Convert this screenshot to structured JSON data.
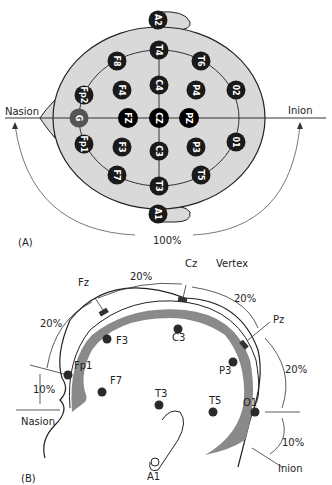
{
  "panel_a": {
    "label": "(A)",
    "nasion": "Nasion",
    "inion": "Inion",
    "arc_percent": "100%",
    "electrodes": [
      {
        "id": "A2",
        "type": "ear"
      },
      {
        "id": "A1",
        "type": "ear"
      },
      {
        "id": "T4",
        "type": "ring"
      },
      {
        "id": "F8",
        "type": "ring"
      },
      {
        "id": "T6",
        "type": "ring"
      },
      {
        "id": "Fp2",
        "type": "ring"
      },
      {
        "id": "02",
        "type": "ring"
      },
      {
        "id": "G",
        "type": "ground"
      },
      {
        "id": "Fp1",
        "type": "ring"
      },
      {
        "id": "01",
        "type": "ring"
      },
      {
        "id": "F7",
        "type": "ring"
      },
      {
        "id": "T5",
        "type": "ring"
      },
      {
        "id": "T3",
        "type": "ring"
      },
      {
        "id": "F4",
        "type": "inner"
      },
      {
        "id": "C4",
        "type": "inner"
      },
      {
        "id": "P4",
        "type": "inner"
      },
      {
        "id": "F3",
        "type": "inner"
      },
      {
        "id": "C3",
        "type": "inner"
      },
      {
        "id": "P3",
        "type": "inner"
      },
      {
        "id": "FZ",
        "type": "midline"
      },
      {
        "id": "CZ",
        "type": "midline"
      },
      {
        "id": "PZ",
        "type": "midline"
      }
    ]
  },
  "panel_b": {
    "label": "(B)",
    "vertex": "Vertex",
    "nasion": "Nasion",
    "inion": "Inion",
    "midline_labels": [
      "Fz",
      "Cz",
      "Pz"
    ],
    "percent_labels": {
      "fz_cz": "20%",
      "cz_pz": "20%",
      "fp1_fz": "20%",
      "pz_o1": "20%",
      "nasion_fp1": "10%",
      "o1_inion": "10%"
    },
    "electrodes": [
      "Fp1",
      "F3",
      "F7",
      "C3",
      "T3",
      "T5",
      "P3",
      "O1",
      "A1"
    ]
  },
  "colors": {
    "head_fill": "#d9d9d9",
    "electrode_dark": "#1a1a1a",
    "ground": "#555555",
    "brain_band": "#8a8a8a",
    "line": "#222222"
  }
}
